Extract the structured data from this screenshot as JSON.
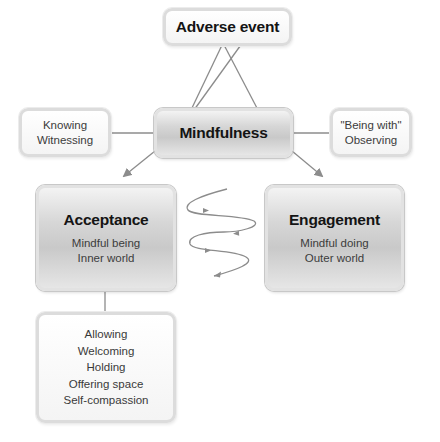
{
  "diagram": {
    "top_node": {
      "title": "Adverse event"
    },
    "center_node": {
      "title": "Mindfulness"
    },
    "left_attribute": {
      "lines": [
        "Knowing",
        "Witnessing"
      ]
    },
    "right_attribute": {
      "lines": [
        "\"Being with\"",
        "Observing"
      ]
    },
    "acceptance": {
      "title": "Acceptance",
      "lines": [
        "Mindful being",
        "Inner world"
      ]
    },
    "engagement": {
      "title": "Engagement",
      "lines": [
        "Mindful doing",
        "Outer world"
      ]
    },
    "acceptance_details": {
      "lines": [
        "Allowing",
        "Welcoming",
        "Holding",
        "Offering space",
        "Self-compassion"
      ]
    },
    "connector_color": "#8c8c8c",
    "spiral_arrow_icon": "oscillating-spiral-arrows"
  }
}
